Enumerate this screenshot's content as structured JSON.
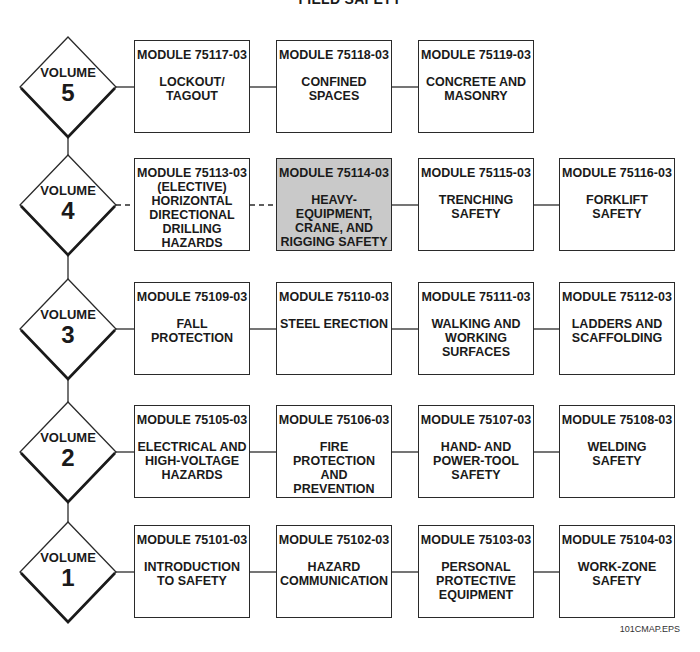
{
  "title": "FIELD SAFETY",
  "footer": "101CMAP.EPS",
  "highlight_color": "#c9c9c9",
  "volumes": [
    {
      "label": "VOLUME",
      "number": "5",
      "modules": [
        {
          "code": "MODULE 75117-03",
          "name": "LOCKOUT/ TAGOUT"
        },
        {
          "code": "MODULE 75118-03",
          "name": "CONFINED SPACES"
        },
        {
          "code": "MODULE 75119-03",
          "name": "CONCRETE AND MASONRY"
        }
      ]
    },
    {
      "label": "VOLUME",
      "number": "4",
      "modules": [
        {
          "code": "MODULE 75113-03",
          "name": "(ELECTIVE) HORIZONTAL DIRECTIONAL DRILLING HAZARDS",
          "elective": true
        },
        {
          "code": "MODULE 75114-03",
          "name": "HEAVY- EQUIPMENT, CRANE, AND RIGGING SAFETY",
          "highlighted": true
        },
        {
          "code": "MODULE 75115-03",
          "name": "TRENCHING SAFETY"
        },
        {
          "code": "MODULE 75116-03",
          "name": "FORKLIFT SAFETY"
        }
      ]
    },
    {
      "label": "VOLUME",
      "number": "3",
      "modules": [
        {
          "code": "MODULE 75109-03",
          "name": "FALL PROTECTION"
        },
        {
          "code": "MODULE 75110-03",
          "name": "STEEL ERECTION"
        },
        {
          "code": "MODULE 75111-03",
          "name": "WALKING AND WORKING SURFACES"
        },
        {
          "code": "MODULE 75112-03",
          "name": "LADDERS AND SCAFFOLDING"
        }
      ]
    },
    {
      "label": "VOLUME",
      "number": "2",
      "modules": [
        {
          "code": "MODULE 75105-03",
          "name": "ELECTRICAL AND HIGH-VOLTAGE HAZARDS"
        },
        {
          "code": "MODULE 75106-03",
          "name": "FIRE PROTECTION AND PREVENTION"
        },
        {
          "code": "MODULE 75107-03",
          "name": "HAND- AND POWER-TOOL SAFETY"
        },
        {
          "code": "MODULE 75108-03",
          "name": "WELDING SAFETY"
        }
      ]
    },
    {
      "label": "VOLUME",
      "number": "1",
      "modules": [
        {
          "code": "MODULE 75101-03",
          "name": "INTRODUCTION TO SAFETY"
        },
        {
          "code": "MODULE 75102-03",
          "name": "HAZARD COMMUNICATION"
        },
        {
          "code": "MODULE 75103-03",
          "name": "PERSONAL PROTECTIVE EQUIPMENT"
        },
        {
          "code": "MODULE 75104-03",
          "name": "WORK-ZONE SAFETY"
        }
      ]
    }
  ]
}
